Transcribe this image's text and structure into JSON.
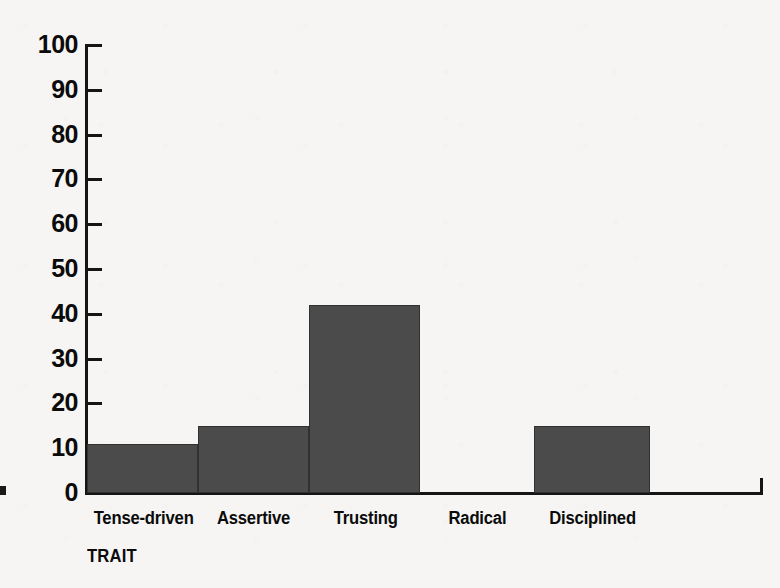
{
  "chart_data": {
    "type": "bar",
    "title": "",
    "subtitle": "",
    "xlabel": "TRAIT",
    "ylabel": "",
    "categories": [
      "Tense-driven",
      "Assertive",
      "Trusting",
      "Radical",
      "Disciplined"
    ],
    "values": [
      11,
      15,
      42,
      0,
      15
    ],
    "ylim": [
      0,
      100
    ],
    "y_ticks": [
      0,
      10,
      20,
      30,
      40,
      50,
      60,
      70,
      80,
      90,
      100
    ],
    "y_tick_labels": [
      "0",
      "10",
      "20",
      "30",
      "40",
      "50",
      "60",
      "70",
      "80",
      "90",
      "100"
    ],
    "grid": false,
    "legend": "none",
    "bars_adjacent": true,
    "colors": {
      "background": "#f6f5f3",
      "bar_fill": "#4b4b4b",
      "axis": "#151515",
      "text": "#0b0b0b"
    }
  },
  "axis": {
    "y_top_label": "100",
    "x_title": "TRAIT"
  }
}
